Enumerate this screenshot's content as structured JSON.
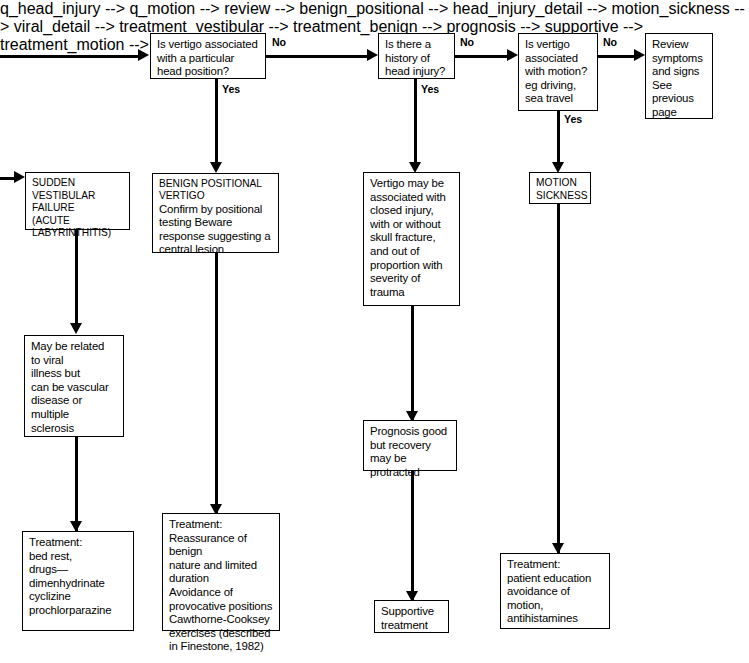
{
  "diagram": {
    "type": "clinical-decision-flowchart",
    "ink_color": "#000000",
    "background_color": "#ffffff"
  },
  "nodes": {
    "q_head_position": {
      "text": "Is vertigo associated\nwith a particular\nhead position?",
      "kind": "decision"
    },
    "q_head_injury": {
      "text": "Is there a\nhistory of\nhead injury?",
      "kind": "decision"
    },
    "q_motion": {
      "text": "Is vertigo\nassociated\nwith motion?\neg driving,\nsea travel",
      "kind": "decision"
    },
    "review": {
      "text": "Review\nsymptoms\nand signs\nSee\nprevious\npage",
      "kind": "outcome"
    },
    "sudden_vestibular": {
      "text": "SUDDEN\nVESTIBULAR\nFAILURE\n(ACUTE\nLABYRINTHITIS)",
      "kind": "diagnosis"
    },
    "benign_positional": {
      "heading": "BENIGN POSITIONAL\nVERTIGO",
      "text": "Confirm by positional\ntesting  Beware\nresponse suggesting a\ncentral lesion",
      "kind": "diagnosis"
    },
    "head_injury_detail": {
      "text": "Vertigo may be\nassociated with\nclosed injury,\nwith or without\nskull fracture,\nand out of\nproportion with\nseverity of\ntrauma",
      "kind": "detail"
    },
    "motion_sickness": {
      "text": "MOTION\nSICKNESS",
      "kind": "diagnosis"
    },
    "viral_detail": {
      "text": "May be related\nto viral\nillness but\ncan be vascular\ndisease or\nmultiple\nsclerosis",
      "kind": "detail"
    },
    "prognosis": {
      "text": "Prognosis good\nbut recovery\nmay be\nprotracted",
      "kind": "detail"
    },
    "treatment_vestibular": {
      "text": "Treatment:\nbed rest,\ndrugs—\n   dimenhydrinate\n   cyclizine\n   prochlorparazine",
      "kind": "treatment"
    },
    "treatment_benign": {
      "text": "Treatment:\nReassurance of benign\nnature and limited\nduration\nAvoidance of\nprovocative positions\nCawthorne-Cooksey\nexercises (described\nin Finestone, 1982)",
      "kind": "treatment"
    },
    "supportive": {
      "text": "Supportive\ntreatment",
      "kind": "treatment"
    },
    "treatment_motion": {
      "text": "Treatment:\npatient education\navoidance of\nmotion,\nantihistamines",
      "kind": "treatment"
    }
  },
  "edge_labels": {
    "no_1": "No",
    "no_2": "No",
    "no_3": "No",
    "yes_1": "Yes",
    "yes_2": "Yes",
    "yes_3": "Yes"
  }
}
